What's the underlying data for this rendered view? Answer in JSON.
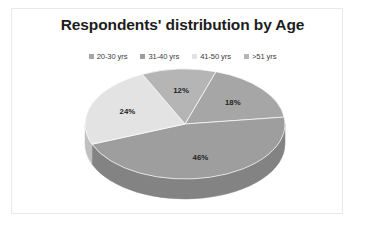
{
  "figure": {
    "frame_color": "#e9e9e9",
    "background": "#ffffff"
  },
  "chart_data": {
    "type": "pie",
    "title": "Respondents' distribution by Age",
    "xlabel": "",
    "ylabel": "",
    "legend_position": "top",
    "grid": false,
    "three_d": true,
    "categories": [
      "20-30 yrs",
      "31-40 yrs",
      "41-50 yrs",
      ">51 yrs"
    ],
    "values": [
      18,
      46,
      24,
      12
    ],
    "value_labels": [
      "18%",
      "46%",
      "24%",
      "12%"
    ],
    "colors": [
      "#a6a6a6",
      "#9e9e9e",
      "#e3e3e3",
      "#b5b5b5"
    ],
    "side_colors": [
      "#8a8a8a",
      "#838383",
      "#c0c0c0",
      "#989898"
    ],
    "slices": [
      {
        "label": "20-30 yrs",
        "value": 18,
        "value_label": "18%",
        "color": "#a6a6a6"
      },
      {
        "label": "31-40 yrs",
        "value": 46,
        "value_label": "46%",
        "color": "#9e9e9e"
      },
      {
        "label": "41-50 yrs",
        "value": 24,
        "value_label": "24%",
        "color": "#e3e3e3"
      },
      {
        "label": ">51 yrs",
        "value": 12,
        "value_label": "12%",
        "color": "#b5b5b5"
      }
    ]
  },
  "legend": {
    "items": [
      {
        "label": "20-30 yrs",
        "color": "#a6a6a6"
      },
      {
        "label": "31-40 yrs",
        "color": "#9e9e9e"
      },
      {
        "label": "41-50 yrs",
        "color": "#e3e3e3"
      },
      {
        "label": ">51 yrs",
        "color": "#b5b5b5"
      }
    ]
  }
}
